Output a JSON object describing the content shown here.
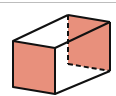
{
  "diagram": {
    "colors": {
      "shade": "#E8907C",
      "edge": "#111111",
      "rule": "#bdbdbd",
      "background": "#ffffff"
    },
    "vertices": {
      "front_top_left": [
        13,
        41
      ],
      "front_top_right": [
        55,
        48
      ],
      "front_bottom_right": [
        55,
        94
      ],
      "front_bottom_left": [
        13,
        87
      ],
      "back_top_left": [
        68,
        15
      ],
      "back_top_right": [
        110,
        22
      ],
      "back_bottom_right": [
        110,
        71
      ],
      "back_bottom_left": [
        68,
        64
      ]
    },
    "shaded_faces": [
      "left-end face",
      "right-end face"
    ],
    "hidden_edges": [
      "back vertical edge",
      "back bottom edge"
    ]
  }
}
